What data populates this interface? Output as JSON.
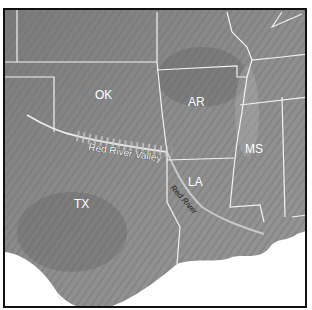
{
  "map": {
    "style": "grayscale shaded relief",
    "colors": {
      "land": "#8a8a8a",
      "water": "#ffffff",
      "borders": "#f2f2f2",
      "frame": "#111111",
      "river": "#bdbdbd"
    },
    "states": [
      {
        "abbr": "OK",
        "x": 103,
        "y": 92
      },
      {
        "abbr": "AR",
        "x": 196,
        "y": 100
      },
      {
        "abbr": "MS",
        "x": 255,
        "y": 147
      },
      {
        "abbr": "LA",
        "x": 196,
        "y": 183
      },
      {
        "abbr": "TX",
        "x": 80,
        "y": 202
      }
    ],
    "features": {
      "valley_label": "Red River Valley",
      "river_label": "Red River"
    }
  }
}
